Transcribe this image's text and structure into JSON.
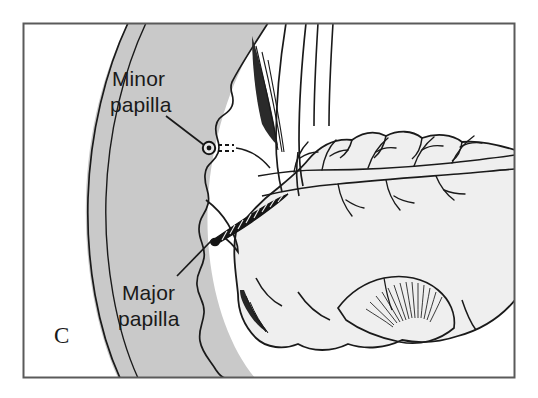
{
  "figure": {
    "panel_letter": "C",
    "type": "anatomical-line-drawing",
    "frame": {
      "border_color": "#5a5a5a",
      "background_color": "#ffffff"
    },
    "colors": {
      "duodenum_fill": "#c9c9c9",
      "pancreas_fill": "#efefef",
      "outline": "#1a1a1a",
      "label_text": "#1a1a1a",
      "leader_line": "#1a1a1a",
      "papilla_dark": "#111111"
    },
    "labels": [
      {
        "id": "minor-papilla",
        "line1": "Minor",
        "line2": "papilla",
        "x": 112,
        "y": 86,
        "leader": {
          "x1": 166,
          "y1": 116,
          "x2": 205,
          "y2": 147
        }
      },
      {
        "id": "major-papilla",
        "line1": "Major",
        "line2": "papilla",
        "x": 120,
        "y": 300,
        "leader": {
          "x1": 177,
          "y1": 276,
          "x2": 212,
          "y2": 240
        }
      }
    ],
    "structures": [
      {
        "name": "duodenum-wall",
        "description": "Curved double-walled duodenal segment on the left with scalloped mucosal folds"
      },
      {
        "name": "duodenal-lumen",
        "description": "Gray-filled interior of the duodenum"
      },
      {
        "name": "minor-papilla-marker",
        "description": "Small circle with dark center and short dashed accessory duct"
      },
      {
        "name": "major-papilla-marker",
        "description": "Tapered dark striated ampulla entering the duodenal wall"
      },
      {
        "name": "pancreas-body",
        "description": "Lobulated pancreas occupying the right side"
      },
      {
        "name": "main-pancreatic-duct",
        "description": "Horizontal double-line duct with branching side ducts"
      },
      {
        "name": "common-bile-duct",
        "description": "Vertical duct descending from the top toward the major papilla"
      },
      {
        "name": "uncinate-process",
        "description": "Lower lobule with fine radiating hatch lines"
      }
    ]
  }
}
